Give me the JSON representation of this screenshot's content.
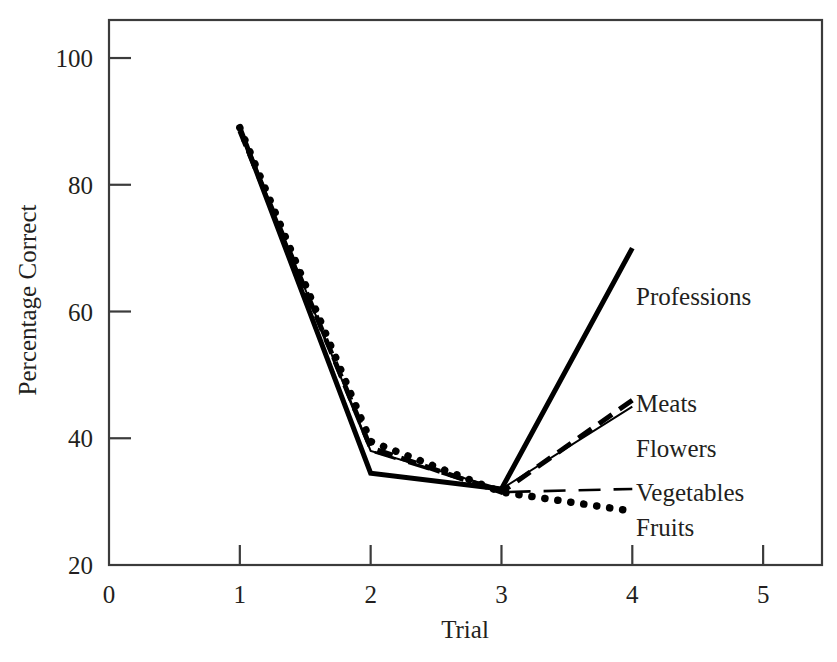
{
  "chart_data": {
    "type": "line",
    "title": "",
    "xlabel": "Trial",
    "ylabel": "Percentage Correct",
    "x": [
      1,
      2,
      3,
      4
    ],
    "xlim": [
      0,
      5.45
    ],
    "ylim": [
      20,
      106
    ],
    "xticks": [
      "0",
      "1",
      "2",
      "3",
      "4",
      "5"
    ],
    "xtick_values": [
      0,
      1,
      2,
      3,
      4,
      5
    ],
    "yticks": [
      "20",
      "40",
      "60",
      "80",
      "100"
    ],
    "ytick_values": [
      20,
      40,
      60,
      80,
      100
    ],
    "grid": false,
    "legend_position": "right-inline-labels",
    "series": [
      {
        "name": "Professions",
        "values": [
          89,
          34.5,
          32,
          70
        ],
        "style": "solid-thick",
        "label_y_value": 62.5
      },
      {
        "name": "Meats",
        "values": [
          88.5,
          38.5,
          31.5,
          46
        ],
        "style": "dashed-thick",
        "label_y_value": 45.5
      },
      {
        "name": "Flowers",
        "values": [
          89,
          38,
          32,
          45
        ],
        "style": "solid-thin",
        "label_y_value": 38.5
      },
      {
        "name": "Vegetables",
        "values": [
          88.5,
          38,
          31.5,
          32
        ],
        "style": "long-dashed",
        "label_y_value": 31.5
      },
      {
        "name": "Fruits",
        "values": [
          89,
          39.5,
          31.5,
          28.5
        ],
        "style": "dotted-thick",
        "label_y_value": 26
      }
    ]
  },
  "axes": {
    "x_axis_title": "Trial",
    "y_axis_title": "Percentage Correct"
  }
}
